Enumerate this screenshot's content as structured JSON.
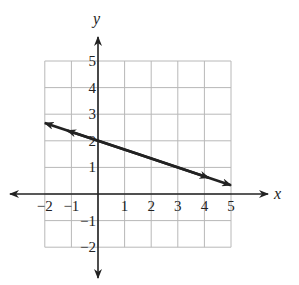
{
  "chart_data": {
    "type": "line",
    "title": "",
    "xlabel": "x",
    "ylabel": "y",
    "xlim": [
      -2,
      5
    ],
    "ylim": [
      -2,
      5
    ],
    "grid": true,
    "x_ticks": [
      "-2",
      "-1",
      "1",
      "2",
      "3",
      "4",
      "5"
    ],
    "y_ticks": [
      "5",
      "4",
      "3",
      "2",
      "1",
      "-1",
      "-2"
    ],
    "series": [
      {
        "name": "line",
        "x": [
          -2,
          0,
          5
        ],
        "y": [
          2.67,
          2,
          0.33
        ],
        "arrows_both_ends": true,
        "color": "#222222"
      }
    ]
  },
  "labels": {
    "x_axis": "x",
    "y_axis": "y",
    "x_tick_values": [
      -2,
      -1,
      1,
      2,
      3,
      4,
      5
    ],
    "y_tick_values": [
      5,
      4,
      3,
      2,
      1,
      -1,
      -2
    ]
  },
  "colors": {
    "grid": "#b8b8b8",
    "axis": "#222222",
    "line": "#222222"
  }
}
